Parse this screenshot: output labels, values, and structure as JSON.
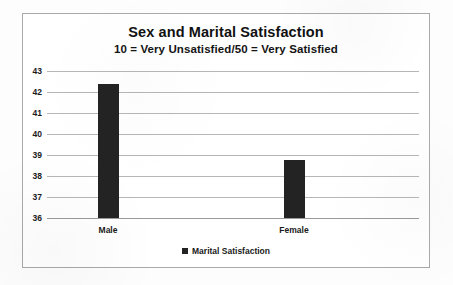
{
  "chart_data": {
    "type": "bar",
    "title": "Sex and Marital Satisfaction",
    "subtitle": "10 = Very Unsatisfied/50 = Very Satisfied",
    "categories": [
      "Male",
      "Female"
    ],
    "series": [
      {
        "name": "Marital Satisfaction",
        "values": [
          42.4,
          38.75
        ],
        "color": "#232323"
      }
    ],
    "xlabel": "",
    "ylabel": "",
    "ylim": [
      36,
      43
    ],
    "ytick_step": 1,
    "yticks": [
      43,
      42,
      41,
      40,
      39,
      38,
      37,
      36
    ],
    "grid": true,
    "legend_position": "bottom",
    "legend_entries": [
      "Marital Satisfaction"
    ],
    "frame_color": "#a9a9a9",
    "gridline_color": "#b6b6b6",
    "background_color": "#ffffff"
  }
}
